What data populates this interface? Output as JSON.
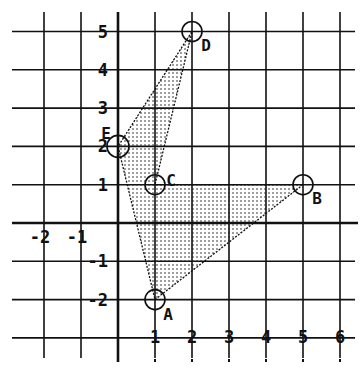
{
  "chart_data": {
    "type": "scatter",
    "title": "",
    "xlabel": "",
    "ylabel": "",
    "grid": true,
    "xlim": [
      -3,
      6
    ],
    "ylim": [
      -3,
      5
    ],
    "x_tick_labels": [
      "-2",
      "-1",
      "1",
      "2",
      "3",
      "4",
      "5",
      "6"
    ],
    "x_ticks": [
      -2,
      -1,
      1,
      2,
      3,
      4,
      5,
      6
    ],
    "y_tick_labels": [
      "5",
      "4",
      "3",
      "2",
      "1",
      "-1",
      "-2"
    ],
    "y_ticks": [
      5,
      4,
      3,
      2,
      1,
      -1,
      -2
    ],
    "points": [
      {
        "label": "A",
        "x": 1,
        "y": -2
      },
      {
        "label": "B",
        "x": 5,
        "y": 1
      },
      {
        "label": "C",
        "x": 1,
        "y": 1
      },
      {
        "label": "D",
        "x": 2,
        "y": 5
      },
      {
        "label": "E",
        "x": 0,
        "y": 2
      }
    ],
    "polygon": [
      "A",
      "B",
      "C",
      "D",
      "E"
    ],
    "fill": "dotted-shading"
  },
  "colors": {
    "ink": "#111111",
    "background": "#ffffff"
  }
}
